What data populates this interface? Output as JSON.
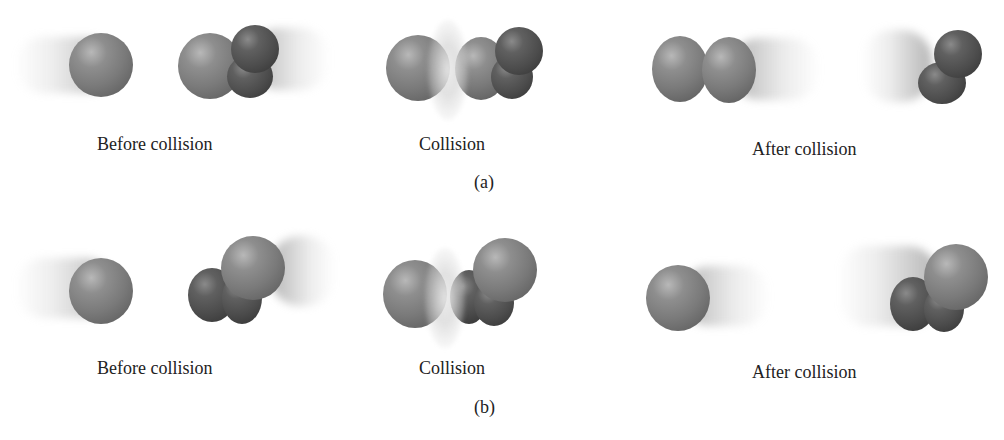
{
  "figure": {
    "rows": [
      {
        "id": "a",
        "sublabel": "(a)",
        "panels": [
          {
            "label": "Before collision"
          },
          {
            "label": "Collision"
          },
          {
            "label": "After collision"
          }
        ]
      },
      {
        "id": "b",
        "sublabel": "(b)",
        "panels": [
          {
            "label": "Before collision"
          },
          {
            "label": "Collision"
          },
          {
            "label": "After collision"
          }
        ]
      }
    ]
  }
}
